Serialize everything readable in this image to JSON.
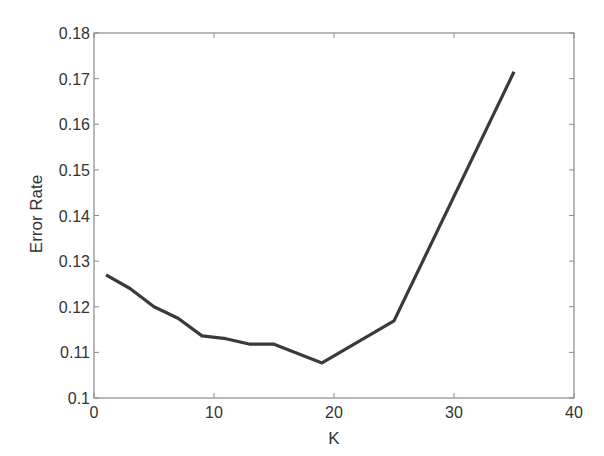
{
  "chart_data": {
    "type": "line",
    "title": "",
    "xlabel": "K",
    "ylabel": "Error Rate",
    "xlim": [
      0,
      40
    ],
    "ylim": [
      0.1,
      0.18
    ],
    "xticks": [
      0,
      10,
      20,
      30,
      40
    ],
    "yticks": [
      0.1,
      0.11,
      0.12,
      0.13,
      0.14,
      0.15,
      0.16,
      0.17,
      0.18
    ],
    "xtick_labels": [
      "0",
      "10",
      "20",
      "30",
      "40"
    ],
    "ytick_labels": [
      "0.1",
      "0.11",
      "0.12",
      "0.13",
      "0.14",
      "0.15",
      "0.16",
      "0.17",
      "0.18"
    ],
    "grid": false,
    "legend": null,
    "series": [
      {
        "name": "Error Rate",
        "color": "#3a3a3a",
        "x": [
          1,
          3,
          5,
          7,
          9,
          11,
          13,
          15,
          19,
          25,
          35
        ],
        "values": [
          0.127,
          0.124,
          0.12,
          0.1175,
          0.1136,
          0.113,
          0.1118,
          0.1118,
          0.1077,
          0.1169,
          0.1715
        ]
      }
    ]
  },
  "colors": {
    "axis": "#8a8a8a",
    "text": "#333333",
    "line": "#3a3a3a",
    "background": "#ffffff"
  }
}
